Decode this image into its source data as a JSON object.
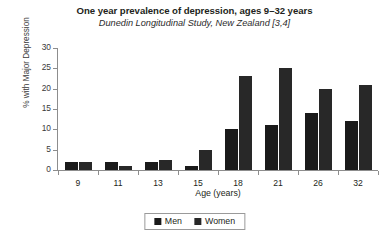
{
  "chart_data": {
    "type": "bar",
    "title": "One year prevalence of depression, ages 9–32 years",
    "subtitle": "Dunedin Longitudinal Study, New Zealand [3,4]",
    "xlabel": "Age (years)",
    "ylabel": "% with Major Depression",
    "categories": [
      "9",
      "11",
      "13",
      "15",
      "18",
      "21",
      "26",
      "32"
    ],
    "series": [
      {
        "name": "Men",
        "color": "#1a1a1a",
        "values": [
          2,
          2,
          2,
          1,
          10,
          11,
          14,
          12
        ]
      },
      {
        "name": "Women",
        "color": "#282828",
        "values": [
          2,
          1,
          2.5,
          5,
          23,
          25,
          20,
          21
        ]
      }
    ],
    "ylim": [
      0,
      30
    ],
    "yticks": [
      0,
      5,
      10,
      15,
      20,
      25,
      30
    ],
    "ytick_labels": [
      "0",
      "5",
      "10",
      "15",
      "20",
      "25",
      "30"
    ],
    "grid": false,
    "legend_position": "bottom-center"
  },
  "legend": {
    "items": [
      {
        "label": "Men"
      },
      {
        "label": "Women"
      }
    ]
  }
}
